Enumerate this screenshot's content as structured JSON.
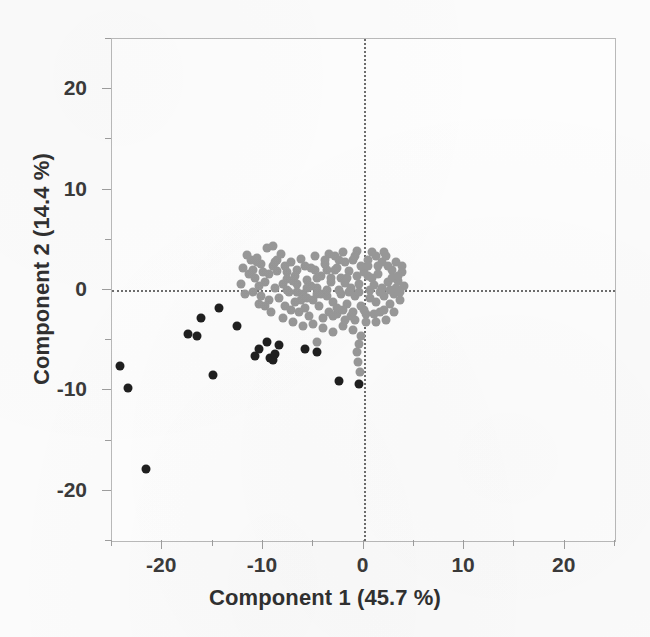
{
  "chart_data": {
    "type": "scatter",
    "title": "",
    "xlabel": "Component 1  (45.7 %)",
    "ylabel": "Component 2  (14.4 %)",
    "xlim": [
      -25,
      25
    ],
    "ylim": [
      -25,
      25
    ],
    "xticks": [
      -20,
      -10,
      0,
      10,
      20
    ],
    "xticklabels": [
      "-20",
      "-10",
      "0",
      "10",
      "20"
    ],
    "yticks": [
      20,
      10,
      0,
      -10,
      -20
    ],
    "yticklabels": [
      "20",
      "10",
      "0",
      "-10",
      "-20"
    ],
    "grid": false,
    "legend": "none",
    "reference_lines": [
      {
        "axis": "x",
        "value": 0,
        "style": "dotted",
        "color": "#6d6d6d"
      },
      {
        "axis": "y",
        "value": 0,
        "style": "dotted",
        "color": "#6d6d6d"
      }
    ],
    "colors": {
      "group_grey": "#989898",
      "group_black": "#1f1f1f",
      "frame": "#b9b9b9",
      "text": "#303030"
    },
    "series": [
      {
        "name": "grey-cluster",
        "color": "#989898",
        "marker": "circle",
        "points": [
          [
            -11.6,
            3.5
          ],
          [
            -11.2,
            3.0
          ],
          [
            -12.0,
            2.2
          ],
          [
            -11.0,
            2.0
          ],
          [
            -10.6,
            3.2
          ],
          [
            -10.2,
            2.6
          ],
          [
            -9.6,
            4.2
          ],
          [
            -9.0,
            4.4
          ],
          [
            -10.8,
            1.2
          ],
          [
            -10.4,
            0.4
          ],
          [
            -11.0,
            -0.2
          ],
          [
            -10.2,
            -0.6
          ],
          [
            -9.8,
            0.8
          ],
          [
            -9.4,
            1.6
          ],
          [
            -9.0,
            2.4
          ],
          [
            -8.6,
            3.0
          ],
          [
            -8.2,
            3.6
          ],
          [
            -8.8,
            0.2
          ],
          [
            -8.4,
            -0.8
          ],
          [
            -8.0,
            0.6
          ],
          [
            -7.6,
            1.8
          ],
          [
            -7.2,
            2.8
          ],
          [
            -7.8,
            -1.6
          ],
          [
            -7.4,
            -0.2
          ],
          [
            -7.0,
            0.9
          ],
          [
            -6.6,
            2.0
          ],
          [
            -6.2,
            3.1
          ],
          [
            -6.8,
            -1.2
          ],
          [
            -6.4,
            -2.2
          ],
          [
            -6.0,
            -0.4
          ],
          [
            -5.6,
            1.0
          ],
          [
            -5.2,
            2.2
          ],
          [
            -4.8,
            3.4
          ],
          [
            -5.8,
            -1.8
          ],
          [
            -5.4,
            -2.6
          ],
          [
            -5.0,
            -1.0
          ],
          [
            -4.6,
            0.2
          ],
          [
            -4.2,
            1.4
          ],
          [
            -3.8,
            2.6
          ],
          [
            -3.4,
            3.6
          ],
          [
            -4.4,
            -1.6
          ],
          [
            -4.0,
            -2.8
          ],
          [
            -3.6,
            -0.6
          ],
          [
            -3.2,
            0.8
          ],
          [
            -2.8,
            2.0
          ],
          [
            -2.4,
            3.0
          ],
          [
            -2.0,
            3.8
          ],
          [
            -3.0,
            -1.2
          ],
          [
            -2.6,
            -2.4
          ],
          [
            -2.2,
            -0.4
          ],
          [
            -1.8,
            0.7
          ],
          [
            -1.4,
            1.9
          ],
          [
            -1.0,
            3.0
          ],
          [
            -0.6,
            3.9
          ],
          [
            -1.6,
            -1.4
          ],
          [
            -1.2,
            -2.6
          ],
          [
            -0.8,
            -0.6
          ],
          [
            -0.4,
            0.6
          ],
          [
            0.0,
            1.8
          ],
          [
            0.4,
            3.0
          ],
          [
            0.8,
            3.8
          ],
          [
            -0.2,
            -1.6
          ],
          [
            0.2,
            -2.4
          ],
          [
            0.6,
            -0.8
          ],
          [
            1.0,
            0.5
          ],
          [
            1.4,
            1.6
          ],
          [
            1.8,
            2.8
          ],
          [
            2.2,
            3.4
          ],
          [
            1.2,
            -1.2
          ],
          [
            1.6,
            -2.2
          ],
          [
            2.0,
            -0.6
          ],
          [
            2.4,
            0.8
          ],
          [
            2.8,
            2.0
          ],
          [
            3.2,
            2.8
          ],
          [
            2.6,
            -1.4
          ],
          [
            3.0,
            -0.4
          ],
          [
            3.4,
            0.9
          ],
          [
            3.8,
            1.8
          ],
          [
            3.6,
            -1.0
          ],
          [
            4.0,
            0.4
          ],
          [
            -9.2,
            -2.2
          ],
          [
            -8.0,
            -2.8
          ],
          [
            -7.0,
            -3.2
          ],
          [
            -6.0,
            -3.6
          ],
          [
            -5.0,
            -3.4
          ],
          [
            -4.0,
            -3.8
          ],
          [
            -3.0,
            -4.2
          ],
          [
            -2.0,
            -3.6
          ],
          [
            -1.0,
            -4.0
          ],
          [
            -0.2,
            -4.6
          ],
          [
            -0.4,
            -5.4
          ],
          [
            -0.6,
            -6.2
          ],
          [
            -0.5,
            -7.2
          ],
          [
            -0.3,
            -8.2
          ],
          [
            -4.6,
            -5.2
          ],
          [
            -3.4,
            -2.2
          ],
          [
            -2.6,
            -1.8
          ],
          [
            -6.2,
            -1.0
          ],
          [
            -7.6,
            1.1
          ],
          [
            -8.6,
            1.9
          ],
          [
            -9.4,
            -1.0
          ],
          [
            -10.0,
            1.8
          ],
          [
            -10.6,
            2.8
          ],
          [
            -11.4,
            1.6
          ],
          [
            -12.2,
            0.6
          ],
          [
            -11.8,
            -0.4
          ],
          [
            -5.2,
            0.4
          ],
          [
            -4.2,
            -0.4
          ],
          [
            -3.2,
            1.2
          ],
          [
            -2.2,
            1.2
          ],
          [
            -1.2,
            0.2
          ],
          [
            -0.2,
            2.4
          ],
          [
            0.8,
            1.2
          ],
          [
            1.8,
            0.2
          ],
          [
            2.8,
            1.2
          ],
          [
            3.2,
            0.2
          ],
          [
            0.4,
            2.4
          ],
          [
            1.2,
            3.4
          ],
          [
            2.0,
            3.8
          ],
          [
            -0.8,
            3.4
          ],
          [
            -1.8,
            2.8
          ],
          [
            -2.8,
            3.4
          ],
          [
            -3.8,
            3.0
          ],
          [
            -4.8,
            2.0
          ],
          [
            -5.8,
            2.4
          ],
          [
            -6.8,
            1.4
          ],
          [
            -7.8,
            2.4
          ],
          [
            -8.8,
            2.8
          ],
          [
            -2.4,
            0.0
          ],
          [
            -1.4,
            -0.2
          ],
          [
            -0.4,
            -0.2
          ],
          [
            0.6,
            0.0
          ],
          [
            1.6,
            -0.2
          ],
          [
            2.6,
            0.0
          ],
          [
            3.6,
            -0.2
          ],
          [
            -3.6,
            0.0
          ],
          [
            -4.6,
            -0.4
          ],
          [
            -5.6,
            0.2
          ],
          [
            -6.6,
            -0.2
          ],
          [
            -7.6,
            0.0
          ],
          [
            -2.0,
            -2.0
          ],
          [
            -1.0,
            -2.2
          ],
          [
            0.0,
            -2.0
          ],
          [
            1.0,
            -2.4
          ],
          [
            2.0,
            -2.0
          ],
          [
            3.0,
            -2.2
          ],
          [
            -3.0,
            -2.6
          ],
          [
            2.2,
            -3.0
          ],
          [
            1.2,
            -3.2
          ],
          [
            0.2,
            -3.2
          ],
          [
            -0.8,
            -3.0
          ],
          [
            -1.8,
            -3.0
          ],
          [
            3.4,
            1.4
          ],
          [
            3.8,
            2.4
          ],
          [
            2.4,
            2.4
          ],
          [
            1.4,
            2.4
          ],
          [
            0.4,
            1.4
          ],
          [
            -0.6,
            1.4
          ],
          [
            -1.6,
            1.2
          ],
          [
            -2.6,
            2.2
          ],
          [
            -3.6,
            2.0
          ],
          [
            -4.6,
            1.2
          ],
          [
            -5.6,
            -0.8
          ],
          [
            -6.6,
            0.6
          ],
          [
            -7.2,
            -2.0
          ],
          [
            -9.8,
            -1.6
          ],
          [
            -10.4,
            -1.4
          ]
        ]
      },
      {
        "name": "black-outliers",
        "color": "#1f1f1f",
        "marker": "circle",
        "points": [
          [
            -24.2,
            -7.6
          ],
          [
            -23.4,
            -9.8
          ],
          [
            -21.6,
            -17.8
          ],
          [
            -17.4,
            -4.4
          ],
          [
            -16.6,
            -4.6
          ],
          [
            -16.2,
            -2.8
          ],
          [
            -14.4,
            -1.8
          ],
          [
            -15.0,
            -8.5
          ],
          [
            -12.6,
            -3.6
          ],
          [
            -10.8,
            -6.6
          ],
          [
            -10.4,
            -5.9
          ],
          [
            -9.6,
            -5.2
          ],
          [
            -9.3,
            -6.8
          ],
          [
            -9.0,
            -7.0
          ],
          [
            -8.8,
            -6.4
          ],
          [
            -8.4,
            -5.5
          ],
          [
            -5.8,
            -5.9
          ],
          [
            -4.6,
            -6.2
          ],
          [
            -2.4,
            -9.1
          ],
          [
            -0.4,
            -9.4
          ]
        ]
      }
    ]
  },
  "axes": {
    "x_title": "Component 1  (45.7 %)",
    "y_title": "Component 2  (14.4 %)"
  }
}
